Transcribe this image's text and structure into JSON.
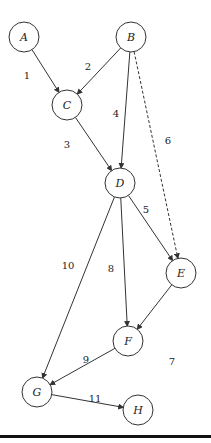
{
  "diagram": {
    "type": "directed-graph",
    "nodes": [
      {
        "id": "A",
        "label": "A",
        "x": 24,
        "y": 37
      },
      {
        "id": "B",
        "label": "B",
        "x": 131,
        "y": 37
      },
      {
        "id": "C",
        "label": "C",
        "x": 67,
        "y": 105
      },
      {
        "id": "D",
        "label": "D",
        "x": 120,
        "y": 183
      },
      {
        "id": "E",
        "label": "E",
        "x": 181,
        "y": 273
      },
      {
        "id": "F",
        "label": "F",
        "x": 128,
        "y": 341
      },
      {
        "id": "G",
        "label": "G",
        "x": 37,
        "y": 392
      },
      {
        "id": "H",
        "label": "H",
        "x": 138,
        "y": 410
      }
    ],
    "edges": [
      {
        "from": "A",
        "to": "C",
        "label": "1",
        "style": "solid"
      },
      {
        "from": "B",
        "to": "C",
        "label": "2",
        "style": "solid"
      },
      {
        "from": "C",
        "to": "D",
        "label": "3",
        "style": "solid"
      },
      {
        "from": "B",
        "to": "D",
        "label": "4",
        "style": "solid"
      },
      {
        "from": "D",
        "to": "E",
        "label": "5",
        "style": "solid"
      },
      {
        "from": "B",
        "to": "E",
        "label": "6",
        "style": "dashed"
      },
      {
        "from": "E",
        "to": "F",
        "label": "7",
        "style": "solid"
      },
      {
        "from": "D",
        "to": "F",
        "label": "8",
        "style": "solid"
      },
      {
        "from": "F",
        "to": "G",
        "label": "9",
        "style": "solid"
      },
      {
        "from": "D",
        "to": "G",
        "label": "10",
        "style": "solid"
      },
      {
        "from": "G",
        "to": "H",
        "label": "11",
        "style": "solid"
      }
    ]
  }
}
